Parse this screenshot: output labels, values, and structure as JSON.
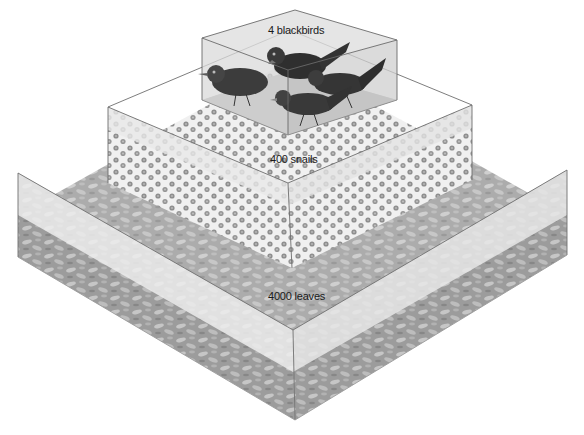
{
  "diagram": {
    "type": "ecological pyramid of numbers",
    "levels": [
      {
        "id": "top",
        "label": "4 blackbirds",
        "count": 4,
        "organism": "blackbirds"
      },
      {
        "id": "middle",
        "label": "400 snails",
        "count": 400,
        "organism": "snails"
      },
      {
        "id": "bottom",
        "label": "4000 leaves",
        "count": 4000,
        "organism": "leaves"
      }
    ]
  },
  "colors": {
    "edge": "#6e6e6e",
    "glass_top": "#e6e6e6",
    "glass_side_left": "#ececec",
    "glass_side_right": "#e2e2e2",
    "leaf_floor": "#9a9a9a",
    "leaf_light": "#c4c4c4",
    "snail_floor": "#f1f1f1",
    "snail_shell": "#8c8c8c",
    "bird_floor": "#a8a8a8",
    "bird_body": "#3a3a3a",
    "background": "#ffffff"
  }
}
